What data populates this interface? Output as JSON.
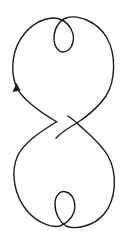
{
  "diagram": {
    "type": "knot-curve",
    "stroke_color": "#1a1a1a",
    "background": "#ffffff",
    "components": [
      {
        "name": "upper-lobe",
        "kind": "curve"
      },
      {
        "name": "upper-small-loop",
        "kind": "loop"
      },
      {
        "name": "middle-crossing",
        "kind": "crossing"
      },
      {
        "name": "lower-lobe",
        "kind": "curve"
      },
      {
        "name": "lower-small-loop",
        "kind": "loop"
      },
      {
        "name": "direction-arrow",
        "kind": "arrow",
        "direction": "up"
      }
    ]
  }
}
